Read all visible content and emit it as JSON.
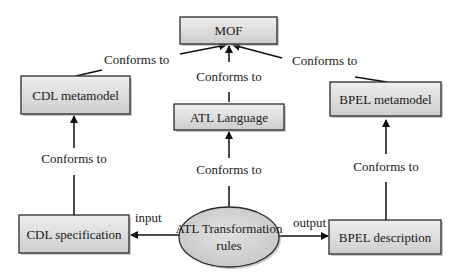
{
  "diagram": {
    "title": "",
    "colors": {
      "box_fill_top": "#ececec",
      "box_fill_bottom": "#cfcfcf",
      "stroke": "#2b2b2b",
      "ellipse_fill": "#d4d4d4"
    },
    "nodes": {
      "mof": {
        "label": "MOF",
        "shape": "rect"
      },
      "cdl_metamodel": {
        "label": "CDL metamodel",
        "shape": "rect"
      },
      "atl_language": {
        "label": "ATL Language",
        "shape": "rect"
      },
      "bpel_metamodel": {
        "label": "BPEL metamodel",
        "shape": "rect"
      },
      "cdl_specification": {
        "label": "CDL specification",
        "shape": "rect"
      },
      "atl_rules": {
        "label_line1": "ATL Transformation",
        "label_line2": "rules",
        "shape": "ellipse"
      },
      "bpel_description": {
        "label": "BPEL description",
        "shape": "rect"
      }
    },
    "edges": {
      "cdl_meta_to_mof": {
        "from": "CDL metamodel",
        "to": "MOF",
        "label": "Conforms to"
      },
      "atl_lang_to_mof": {
        "from": "ATL Language",
        "to": "MOF",
        "label": "Conforms to"
      },
      "bpel_meta_to_mof": {
        "from": "BPEL metamodel",
        "to": "MOF",
        "label": "Conforms to"
      },
      "cdl_spec_to_cdl_meta": {
        "from": "CDL specification",
        "to": "CDL metamodel",
        "label": "Conforms to"
      },
      "atl_rules_to_atl_lang": {
        "from": "ATL Transformation rules",
        "to": "ATL Language",
        "label": "Conforms to"
      },
      "bpel_desc_to_bpel_meta": {
        "from": "BPEL description",
        "to": "BPEL metamodel",
        "label": "Conforms to"
      },
      "atl_rules_to_cdl_spec": {
        "from": "ATL Transformation rules",
        "to": "CDL specification",
        "label": "input"
      },
      "atl_rules_to_bpel_desc": {
        "from": "ATL Transformation rules",
        "to": "BPEL description",
        "label": "output"
      }
    }
  }
}
